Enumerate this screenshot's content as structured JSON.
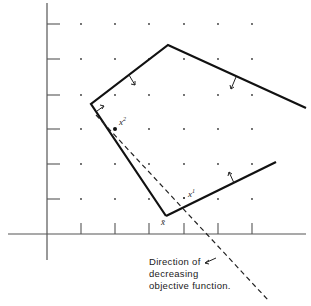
{
  "figure": {
    "type": "linear-programming feasible region diagram",
    "axes": {
      "origin": [
        47,
        234
      ],
      "x_ticks_px": [
        81,
        115,
        149,
        184,
        218,
        252
      ],
      "y_ticks_px": [
        24,
        59,
        95,
        129,
        164,
        199
      ],
      "color": "#555555"
    },
    "grid_dots": {
      "xs": [
        81,
        115,
        149,
        184,
        218,
        252
      ],
      "ys": [
        24,
        59,
        95,
        129,
        164,
        199
      ],
      "color": "#333333"
    },
    "constraint_boundary_upper": {
      "points": [
        [
          166,
          216
        ],
        [
          91,
          104
        ],
        [
          168,
          45
        ],
        [
          306,
          108
        ]
      ],
      "color": "#111111"
    },
    "constraint_boundary_lower": {
      "points": [
        [
          166,
          216
        ],
        [
          276,
          162
        ]
      ],
      "color": "#111111"
    },
    "objective_direction_line": {
      "from": [
        95,
        115
      ],
      "to": [
        268,
        300
      ],
      "style": "dashed"
    },
    "points": {
      "x_bar": {
        "label": "x̄",
        "pos": [
          166,
          216
        ]
      },
      "x1": {
        "label": "x",
        "superscript": "1",
        "pos": [
          188,
          200
        ]
      },
      "x2": {
        "label": "x",
        "superscript": "2",
        "pos": [
          116,
          128
        ]
      }
    },
    "caption": {
      "lines": [
        "Direction of",
        "decreasing",
        "objective function."
      ]
    }
  }
}
